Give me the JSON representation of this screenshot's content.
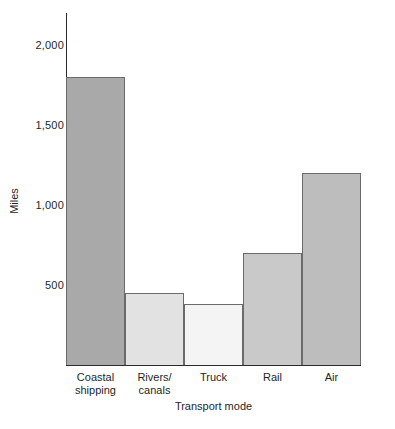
{
  "chart_data": {
    "type": "bar",
    "title": "",
    "xlabel": "Transport mode",
    "ylabel": "Miles",
    "categories": [
      "Coastal shipping",
      "Rivers/canals",
      "Truck",
      "Rail",
      "Air"
    ],
    "category_lines": [
      [
        "Coastal",
        "shipping"
      ],
      [
        "Rivers/",
        "canals"
      ],
      [
        "Truck"
      ],
      [
        "Rail"
      ],
      [
        "Air"
      ]
    ],
    "values": [
      1800,
      450,
      380,
      700,
      1200
    ],
    "bar_colors": [
      "#a9a9a9",
      "#e2e2e2",
      "#f4f4f4",
      "#c9c9c9",
      "#bdbdbd"
    ],
    "bar_border_color": "#6b6b6b",
    "ylim": [
      0,
      2200
    ],
    "y_ticks": [
      500,
      1000,
      1500,
      2000
    ],
    "y_tick_labels": [
      "500",
      "1,000",
      "1,500",
      "2,000"
    ],
    "grid": false,
    "legend": "none"
  },
  "axis": {
    "y_title": "Miles",
    "x_title": "Transport mode"
  }
}
